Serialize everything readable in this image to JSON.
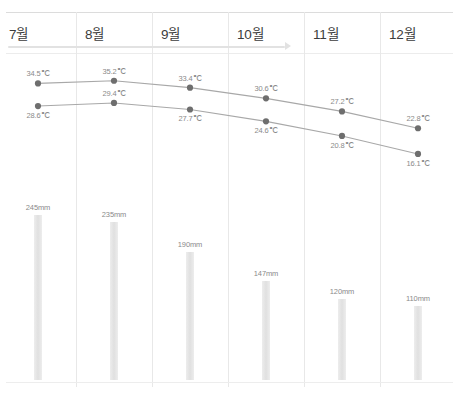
{
  "chart_data": {
    "type": "line",
    "title": "",
    "xlabel": "",
    "ylabel": "",
    "categories": [
      "7월",
      "8월",
      "9월",
      "10월",
      "11월",
      "12월"
    ],
    "series": [
      {
        "name": "high-temperature",
        "unit": "℃",
        "values": [
          34.5,
          35.2,
          33.4,
          30.6,
          27.2,
          22.8
        ],
        "labels": [
          "34.5℃",
          "35.2℃",
          "33.4℃",
          "30.6℃",
          "27.2℃",
          "22.8℃"
        ]
      },
      {
        "name": "low-temperature",
        "unit": "℃",
        "values": [
          28.6,
          29.4,
          27.7,
          24.6,
          20.8,
          16.1
        ],
        "labels": [
          "28.6℃",
          "29.4℃",
          "27.7℃",
          "24.6℃",
          "20.8℃",
          "16.1℃"
        ]
      },
      {
        "name": "precipitation",
        "type": "bar",
        "unit": "mm",
        "values": [
          245,
          235,
          190,
          147,
          120,
          110
        ],
        "labels": [
          "245mm",
          "235mm",
          "190mm",
          "147mm",
          "120mm",
          "110mm"
        ]
      }
    ],
    "ylim_temperature": [
      14,
      38
    ],
    "ylim_precipitation": [
      0,
      260
    ],
    "grid": true,
    "legend": "none"
  },
  "header": {
    "months": [
      {
        "label": "7월"
      },
      {
        "label": "8월"
      },
      {
        "label": "9월"
      },
      {
        "label": "10월"
      },
      {
        "label": "11월"
      },
      {
        "label": "12월"
      }
    ]
  },
  "colors": {
    "line": "#a8a8a8",
    "dot": "#6e6e6e",
    "bar": "#e4e4e4",
    "text": "#8a8a8a",
    "header_text": "#3c3c3c",
    "divider": "#e8e8e8",
    "background": "#ffffff"
  },
  "layout": {
    "column_width": 76,
    "column_count": 6,
    "arrow_end_fraction": 0.635
  }
}
